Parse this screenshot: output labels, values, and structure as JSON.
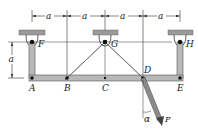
{
  "diagram": {
    "type": "frame-mechanism",
    "dimension_label": "a",
    "top_dimensions": [
      "a",
      "a",
      "a",
      "a"
    ],
    "left_dimension": "a",
    "supports": [
      {
        "label": "F",
        "type": "pin-hanger"
      },
      {
        "label": "G",
        "type": "pin-hanger"
      },
      {
        "label": "H",
        "type": "pin-hanger"
      }
    ],
    "joints": [
      "A",
      "B",
      "C",
      "D",
      "E"
    ],
    "members": [
      "FA",
      "AE",
      "BG",
      "GD",
      "HE"
    ],
    "load": {
      "label": "P",
      "angle_label": "α",
      "applied_at": "D"
    },
    "colors": {
      "member_fill": "#b8b8b8",
      "member_edge": "#555555",
      "support_plate": "#9a9a9a",
      "line": "#333333"
    }
  },
  "labels": {
    "F": "F",
    "G": "G",
    "H": "H",
    "A": "A",
    "B": "B",
    "C": "C",
    "D": "D",
    "E": "E",
    "a1": "a",
    "a2": "a",
    "a3": "a",
    "a4": "a",
    "a_left": "a",
    "P": "P",
    "alpha": "α"
  }
}
